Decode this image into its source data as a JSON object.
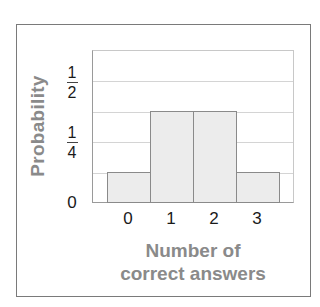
{
  "chart_data": {
    "type": "bar",
    "title": "",
    "xlabel": "Number of correct answers",
    "xlabel_lines": [
      "Number of",
      "correct answers"
    ],
    "ylabel": "Probability",
    "categories": [
      "0",
      "1",
      "2",
      "3"
    ],
    "values": [
      0.125,
      0.375,
      0.375,
      0.125
    ],
    "ylim": [
      0,
      0.625
    ],
    "yticks": [
      {
        "value": 0,
        "label": "0"
      },
      {
        "value": 0.25,
        "label": "1/4",
        "numerator": "1",
        "denominator": "4"
      },
      {
        "value": 0.5,
        "label": "1/2",
        "numerator": "1",
        "denominator": "2"
      }
    ],
    "gridlines": [
      0.125,
      0.25,
      0.375,
      0.5
    ],
    "grid": true,
    "legend": null,
    "bar_gap": 0,
    "colors": {
      "bar_fill": "#ececec",
      "bar_edge": "#8a8a8a",
      "grid": "#d4d4d4",
      "label": "#8a8a8a",
      "frame": "#7a7a7a"
    }
  }
}
